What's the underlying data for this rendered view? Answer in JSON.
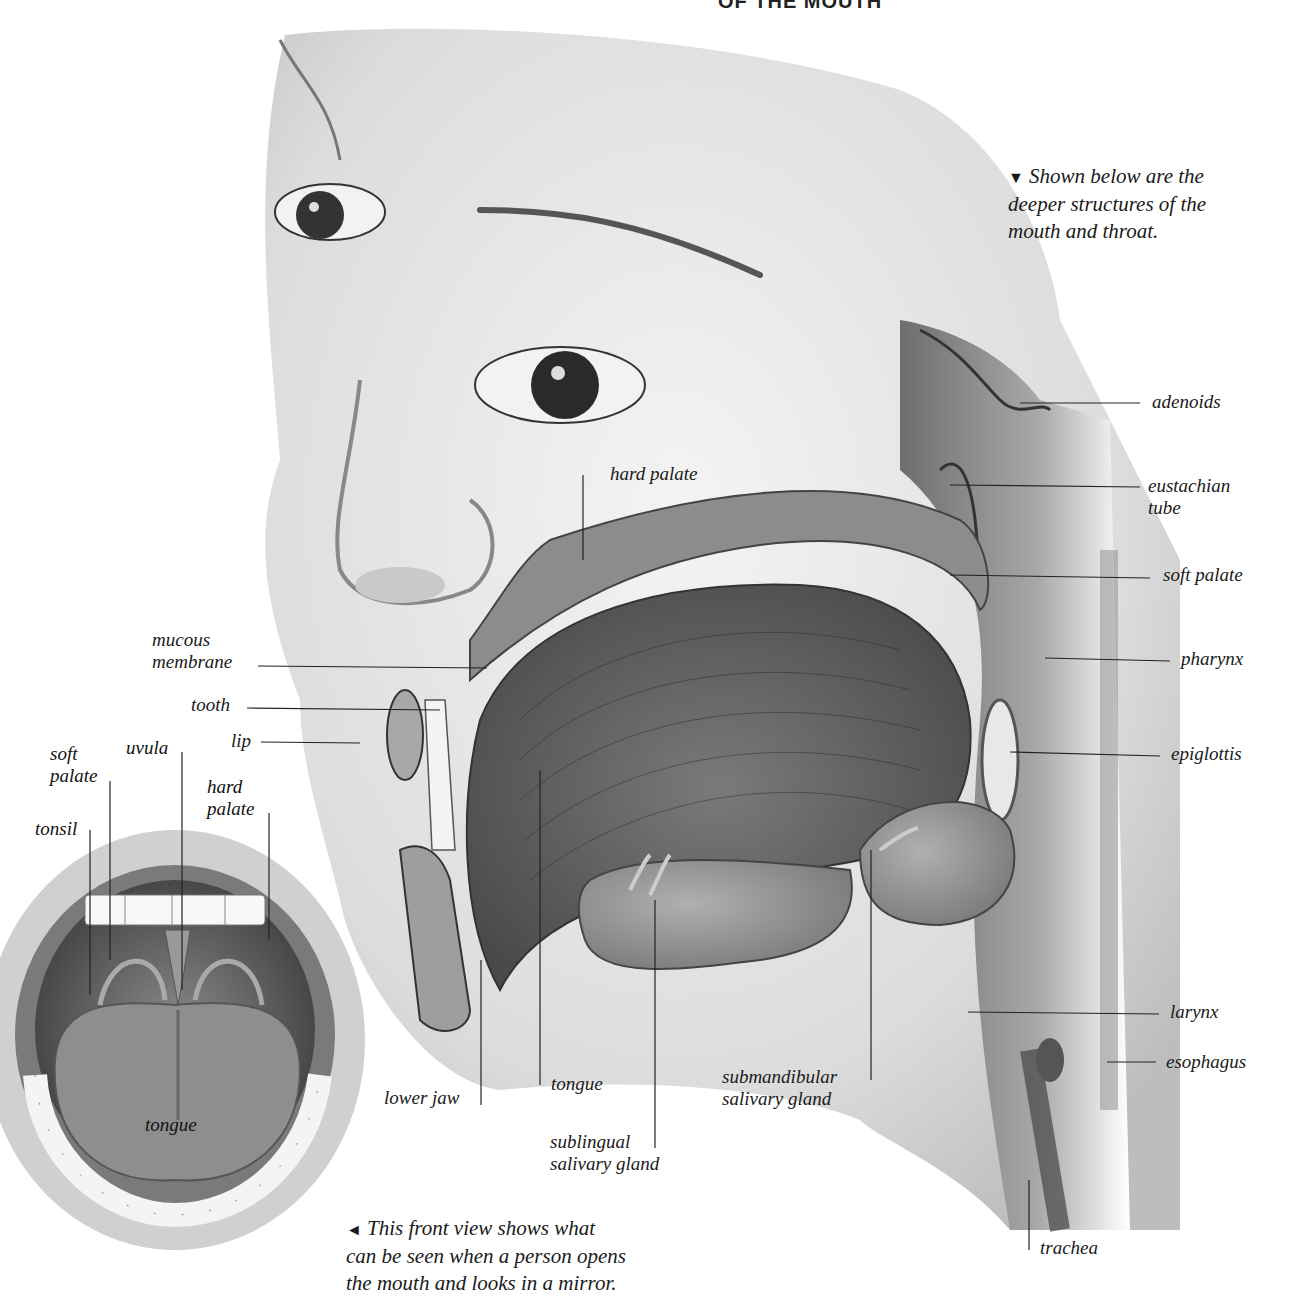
{
  "title": "OF THE MOUTH",
  "captions": {
    "top_right": {
      "marker": "▼",
      "text": "Shown below are the deeper structures of the mouth and throat.",
      "lines": [
        "Shown below are the",
        "deeper structures of the",
        "mouth and throat."
      ]
    },
    "bottom": {
      "marker": "◄",
      "text": "This front view shows what can be seen when a person opens the mouth and looks in a mirror.",
      "lines": [
        "This front view shows what",
        "can be seen when a person opens",
        "the mouth and looks in a mirror."
      ]
    }
  },
  "side_view_labels": {
    "adenoids": "adenoids",
    "eustachian_tube_1": "eustachian",
    "eustachian_tube_2": "tube",
    "soft_palate": "soft palate",
    "pharynx": "pharynx",
    "epiglottis": "epiglottis",
    "larynx": "larynx",
    "esophagus": "esophagus",
    "trachea": "trachea",
    "hard_palate": "hard palate",
    "mucous_membrane_1": "mucous",
    "mucous_membrane_2": "membrane",
    "tooth": "tooth",
    "lip": "lip",
    "lower_jaw": "lower jaw",
    "tongue": "tongue",
    "sublingual_1": "sublingual",
    "sublingual_2": "salivary gland",
    "submandibular_1": "submandibular",
    "submandibular_2": "salivary gland"
  },
  "front_view_labels": {
    "soft_palate_1": "soft",
    "soft_palate_2": "palate",
    "uvula": "uvula",
    "hard_palate_1": "hard",
    "hard_palate_2": "palate",
    "tonsil": "tonsil",
    "tongue": "tongue"
  },
  "colors": {
    "background": "#ffffff",
    "ink": "#1a1a1a",
    "skin_light": "#e6e6e6",
    "tissue_dark": "#555555"
  }
}
